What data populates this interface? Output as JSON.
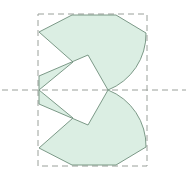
{
  "figure": {
    "width": 188,
    "height": 182,
    "background_color": "#ffffff"
  },
  "style": {
    "fill_color": "#dbeee3",
    "outline_color": "#6f8f7c",
    "outline_width": 0.9,
    "dash_color": "#9aa09a",
    "dash_width": 1.0,
    "dash_pattern": "6 4"
  },
  "bounding_box": {
    "label": "dashed-bounding-box",
    "x": 38,
    "y": 14,
    "width": 109,
    "height": 152,
    "right": 147,
    "bottom": 166
  },
  "axis": {
    "label": "horizontal-symmetry-axis",
    "y": 90,
    "x_start": 2,
    "x_end": 186
  },
  "shape": {
    "label": "sawtooth-arc-polygon",
    "symmetry": "mirror about y=90",
    "vertices_top": [
      [
        39,
        32
      ],
      [
        72,
        15
      ],
      [
        116,
        15
      ],
      [
        146,
        33
      ],
      [
        108,
        90
      ],
      [
        88,
        55
      ],
      [
        39,
        76
      ],
      [
        39,
        90
      ],
      [
        73,
        62
      ],
      [
        39,
        32
      ]
    ],
    "arc_top": {
      "from": [
        146,
        33
      ],
      "to": [
        108,
        90
      ],
      "sweep": "convex-right",
      "rx": 60,
      "ry": 60
    },
    "arc_bottom": {
      "from": [
        108,
        90
      ],
      "to": [
        146,
        147
      ],
      "sweep": "convex-right",
      "rx": 60,
      "ry": 60
    },
    "vertices_bottom": [
      [
        39,
        148
      ],
      [
        72,
        165
      ],
      [
        116,
        165
      ],
      [
        146,
        147
      ],
      [
        108,
        90
      ],
      [
        88,
        125
      ],
      [
        39,
        104
      ],
      [
        39,
        90
      ],
      [
        73,
        118
      ],
      [
        39,
        148
      ]
    ]
  },
  "paths": {
    "outline_top": "M 39 32 L 72 15 L 116 15 L 146 33 A 60 60 0 0 1 108 90 L 88 55 L 39 76 L 39 90 L 73 62 Z",
    "outline_bottom": "M 39 148 L 72 165 L 116 165 L 146 147 A 60 60 0 0 0 108 90 L 88 125 L 39 104 L 39 90 L 73 118 Z"
  }
}
